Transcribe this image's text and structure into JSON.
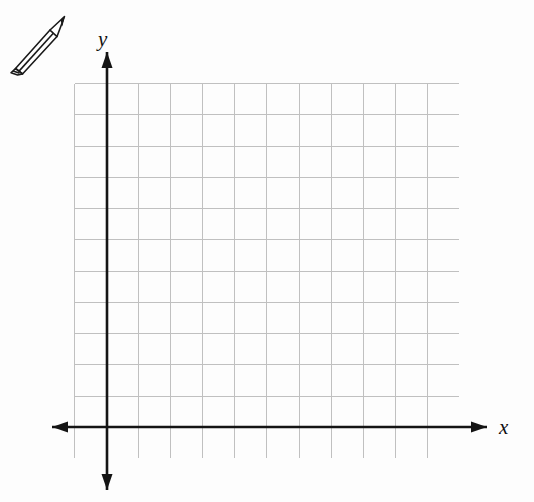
{
  "page": {
    "background_color": "#fdfdfd",
    "width": 534,
    "height": 502
  },
  "icons": {
    "pencil": {
      "name": "pencil-icon",
      "alt_text": "pencil",
      "color": "#1a1a1a",
      "position": {
        "x": 6,
        "y": 12,
        "width": 66,
        "height": 64
      }
    }
  },
  "graph": {
    "name": "coordinate-grid",
    "grid": {
      "columns": 12,
      "rows": 12,
      "left": 74,
      "top": 83,
      "width": 385,
      "height": 375,
      "cell_width": 32.083,
      "cell_height": 31.25,
      "line_color": "#c0c0c0",
      "line_width": 1,
      "show_border": true
    },
    "origin": {
      "x": 107,
      "y": 427,
      "column_index": 1,
      "row_index": 11
    },
    "axes": {
      "color": "#141414",
      "line_width": 2.6,
      "arrow_length": 16,
      "arrow_half_width": 5.5,
      "x_axis": {
        "label": "x",
        "y": 427,
        "start_x": 52,
        "end_x": 487,
        "arrow_start": true,
        "arrow_end": true
      },
      "y_axis": {
        "label": "y",
        "x": 107,
        "start_y": 52,
        "end_y": 490,
        "arrow_start": true,
        "arrow_end": true
      }
    },
    "tick_labels": [],
    "plotted_points": [],
    "plotted_curves": []
  },
  "chart_data": {
    "type": "scatter",
    "title": "",
    "subtitle": "",
    "xlabel": "x",
    "ylabel": "y",
    "x": [],
    "y": [],
    "series": [],
    "xlim": [
      -1,
      11
    ],
    "ylim": [
      -1,
      11
    ],
    "xticks": [],
    "yticks": [],
    "grid": true,
    "grid_columns": 12,
    "grid_rows": 12,
    "legend": null,
    "legend_position": "none",
    "annotations": []
  }
}
